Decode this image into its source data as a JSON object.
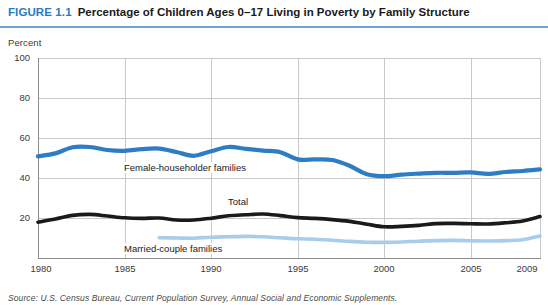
{
  "figure": {
    "label": "FIGURE 1.1",
    "title": "Percentage of Children Ages 0–17 Living in Poverty by Family Structure",
    "accent_color": "#2a7ac0",
    "rule_color": "#6ba3d6"
  },
  "axis": {
    "y_caption": "Percent",
    "y_ticks": [
      "100",
      "80",
      "60",
      "40",
      "20"
    ],
    "x_ticks": [
      "1980",
      "1985",
      "1990",
      "1995",
      "2000",
      "2005",
      "2009"
    ]
  },
  "labels": {
    "female": "Female-householder families",
    "total": "Total",
    "married": "Married-couple families"
  },
  "source": "Source: U.S. Census Bureau, Current Population Survey, Annual Social and Economic Supplements.",
  "chart_data": {
    "type": "line",
    "title": "Percentage of Children Ages 0–17 Living in Poverty by Family Structure",
    "xlabel": "",
    "ylabel": "Percent",
    "xlim": [
      1980,
      2009
    ],
    "ylim": [
      0,
      100
    ],
    "ytick_values": [
      100,
      80,
      60,
      40,
      20
    ],
    "xtick_values": [
      1980,
      1985,
      1990,
      1995,
      2000,
      2005,
      2009
    ],
    "grid": true,
    "legend_position": "inline-annotations",
    "x": [
      1980,
      1981,
      1982,
      1983,
      1984,
      1985,
      1986,
      1987,
      1988,
      1989,
      1990,
      1991,
      1992,
      1993,
      1994,
      1995,
      1996,
      1997,
      1998,
      1999,
      2000,
      2001,
      2002,
      2003,
      2004,
      2005,
      2006,
      2007,
      2008,
      2009
    ],
    "series": [
      {
        "name": "Female-householder families",
        "color": "#2e7dc4",
        "values": [
          50.8,
          52.3,
          55.4,
          55.5,
          54.0,
          53.6,
          54.4,
          54.7,
          53.0,
          51.1,
          53.4,
          55.5,
          54.6,
          53.7,
          52.9,
          49.3,
          49.3,
          49.0,
          46.1,
          41.9,
          40.9,
          41.7,
          42.2,
          42.6,
          42.6,
          42.8,
          42.1,
          43.0,
          43.5,
          44.3
        ]
      },
      {
        "name": "Total",
        "color": "#1a1a1a",
        "values": [
          17.9,
          19.5,
          21.3,
          21.8,
          21.0,
          20.1,
          19.8,
          20.0,
          19.0,
          19.0,
          19.9,
          21.1,
          21.6,
          22.0,
          21.2,
          20.2,
          19.8,
          19.2,
          18.3,
          16.9,
          15.6,
          15.8,
          16.3,
          17.2,
          17.3,
          17.1,
          17.0,
          17.6,
          18.5,
          20.7
        ]
      },
      {
        "name": "Married-couple families",
        "color": "#a8cdea",
        "values": [
          null,
          null,
          null,
          null,
          null,
          null,
          null,
          10.1,
          10.0,
          9.9,
          10.4,
          10.6,
          10.8,
          10.6,
          10.1,
          9.6,
          9.4,
          8.9,
          8.3,
          7.9,
          7.8,
          8.0,
          8.4,
          8.7,
          8.8,
          8.6,
          8.5,
          8.7,
          9.1,
          11.0
        ]
      }
    ]
  },
  "geometry": {
    "plot_left": 38,
    "plot_right": 540,
    "plot_top": 58,
    "plot_bottom": 258,
    "x_min": 1980,
    "x_max": 2009,
    "y_min": 0,
    "y_max": 100
  }
}
